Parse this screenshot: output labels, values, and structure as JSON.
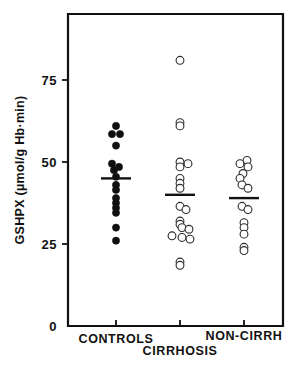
{
  "figure": {
    "background_color": "#ffffff",
    "ink_color": "#111111"
  },
  "axes": {
    "y_axis_title": "GSHPX (µmol/g Hb·min)",
    "y_ticks": [
      {
        "value": 0,
        "label": "0"
      },
      {
        "value": 25,
        "label": "25"
      },
      {
        "value": 50,
        "label": "50"
      },
      {
        "value": 75,
        "label": "75"
      }
    ],
    "y_min": 0,
    "y_max": 90,
    "x_tick_count": 3,
    "grid": "off",
    "legend": "none"
  },
  "groups": [
    {
      "key": "controls",
      "label": "CONTROLS",
      "marker": "filled-circle",
      "mean": 45
    },
    {
      "key": "cirrhosis",
      "label": "CIRRHOSIS",
      "marker": "open-circle",
      "mean": 40
    },
    {
      "key": "non_cirrh",
      "label": "NON-CIRRH",
      "marker": "open-circle",
      "mean": 39
    }
  ],
  "chart_data": {
    "type": "scatter",
    "title": "",
    "xlabel": "",
    "ylabel": "GSHPX (µmol/g Hb·min)",
    "ylim": [
      0,
      90
    ],
    "categories": [
      "CONTROLS",
      "CIRRHOSIS",
      "NON-CIRRH"
    ],
    "series": [
      {
        "name": "CONTROLS",
        "marker": "filled-circle",
        "mean": 45,
        "points": [
          {
            "value": 61.0,
            "offset": 0
          },
          {
            "value": 58.5,
            "offset": -4
          },
          {
            "value": 58.5,
            "offset": 4
          },
          {
            "value": 55.0,
            "offset": 0
          },
          {
            "value": 49.5,
            "offset": -4
          },
          {
            "value": 48.5,
            "offset": 3
          },
          {
            "value": 47.5,
            "offset": -2
          },
          {
            "value": 45.5,
            "offset": 0
          },
          {
            "value": 43.0,
            "offset": 0
          },
          {
            "value": 41.5,
            "offset": 0
          },
          {
            "value": 39.0,
            "offset": 0
          },
          {
            "value": 37.5,
            "offset": 0
          },
          {
            "value": 36.0,
            "offset": 0
          },
          {
            "value": 34.5,
            "offset": 0
          },
          {
            "value": 30.0,
            "offset": 0
          },
          {
            "value": 26.0,
            "offset": 0
          }
        ]
      },
      {
        "name": "CIRRHOSIS",
        "marker": "open-circle",
        "mean": 40,
        "points": [
          {
            "value": 81.0,
            "offset": 0
          },
          {
            "value": 62.0,
            "offset": 0
          },
          {
            "value": 61.0,
            "offset": 0
          },
          {
            "value": 50.0,
            "offset": 0
          },
          {
            "value": 49.5,
            "offset": 8
          },
          {
            "value": 48.5,
            "offset": 0
          },
          {
            "value": 45.0,
            "offset": 0
          },
          {
            "value": 43.5,
            "offset": 0
          },
          {
            "value": 42.0,
            "offset": 0
          },
          {
            "value": 36.5,
            "offset": 0
          },
          {
            "value": 35.5,
            "offset": 6
          },
          {
            "value": 32.0,
            "offset": 0
          },
          {
            "value": 31.0,
            "offset": 0
          },
          {
            "value": 30.0,
            "offset": 2
          },
          {
            "value": 29.5,
            "offset": 9
          },
          {
            "value": 27.5,
            "offset": -8
          },
          {
            "value": 27.0,
            "offset": 2
          },
          {
            "value": 26.5,
            "offset": 10
          },
          {
            "value": 19.5,
            "offset": 0
          },
          {
            "value": 18.5,
            "offset": 0
          }
        ]
      },
      {
        "name": "NON-CIRRH",
        "marker": "open-circle",
        "mean": 39,
        "points": [
          {
            "value": 50.5,
            "offset": 3
          },
          {
            "value": 49.5,
            "offset": -4
          },
          {
            "value": 48.5,
            "offset": 4
          },
          {
            "value": 46.5,
            "offset": -1
          },
          {
            "value": 45.0,
            "offset": -4
          },
          {
            "value": 43.0,
            "offset": -2
          },
          {
            "value": 42.0,
            "offset": 4
          },
          {
            "value": 36.5,
            "offset": -2
          },
          {
            "value": 35.5,
            "offset": 4
          },
          {
            "value": 31.5,
            "offset": 0
          },
          {
            "value": 30.0,
            "offset": 0
          },
          {
            "value": 28.0,
            "offset": 0
          },
          {
            "value": 24.0,
            "offset": 0
          },
          {
            "value": 23.0,
            "offset": 0
          }
        ]
      }
    ]
  }
}
